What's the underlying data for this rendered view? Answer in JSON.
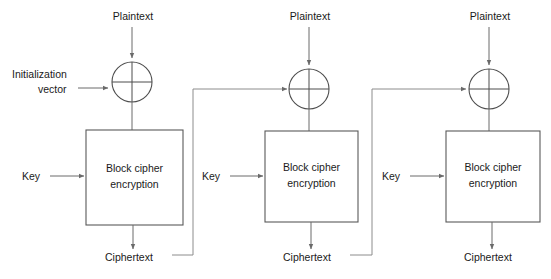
{
  "figure": {
    "background_color": "#ffffff",
    "line_color": "#6a6a6a",
    "text_color": "#1a1a1a",
    "box_fill": "#ffffff",
    "box_stroke": "#595959"
  },
  "labels": {
    "plaintext": "Plaintext",
    "ciphertext": "Ciphertext",
    "key": "Key",
    "iv_line1": "Initialization",
    "iv_line2": "vector",
    "block_cipher_line1": "Block cipher",
    "block_cipher_line2": "encryption"
  },
  "stages": [
    {
      "index": 1,
      "plaintext_label": "Plaintext",
      "plaintext_x": 133,
      "plaintext_y": 20,
      "xor_cx": 132,
      "xor_cy": 82,
      "xor_r": 20,
      "box_x": 86,
      "box_y": 130,
      "box_w": 97,
      "box_h": 95,
      "box_line1": "Block cipher",
      "box_line2": "encryption",
      "key_label": "Key",
      "key_text_x": 22,
      "key_text_y": 180,
      "key_arrow_x1": 50,
      "key_arrow_x2": 84,
      "key_arrow_y": 176,
      "ciphertext_label": "Ciphertext",
      "ciphertext_x": 105,
      "ciphertext_y": 261,
      "has_iv_input": true,
      "has_feedback_out": true,
      "feedback_x": 193
    },
    {
      "index": 2,
      "plaintext_label": "Plaintext",
      "plaintext_x": 310,
      "plaintext_y": 20,
      "xor_cx": 309,
      "xor_cy": 89,
      "xor_r": 20,
      "box_x": 265,
      "box_y": 131,
      "box_w": 93,
      "box_h": 91,
      "box_line1": "Block cipher",
      "box_line2": "encryption",
      "key_label": "Key",
      "key_text_x": 202,
      "key_text_y": 180,
      "key_arrow_x1": 230,
      "key_arrow_x2": 263,
      "key_arrow_y": 176,
      "ciphertext_label": "Ciphertext",
      "ciphertext_x": 283,
      "ciphertext_y": 261,
      "has_iv_input": false,
      "has_feedback_out": true,
      "feedback_x": 372
    },
    {
      "index": 3,
      "plaintext_label": "Plaintext",
      "plaintext_x": 490,
      "plaintext_y": 20,
      "xor_cx": 489,
      "xor_cy": 89,
      "xor_r": 20,
      "box_x": 446,
      "box_y": 131,
      "box_w": 94,
      "box_h": 91,
      "box_line1": "Block cipher",
      "box_line2": "encryption",
      "key_label": "Key",
      "key_text_x": 382,
      "key_text_y": 180,
      "key_arrow_x1": 410,
      "key_arrow_x2": 444,
      "key_arrow_y": 176,
      "ciphertext_label": "Ciphertext",
      "ciphertext_x": 464,
      "ciphertext_y": 261,
      "has_iv_input": false,
      "has_feedback_out": false,
      "feedback_x": null
    }
  ],
  "iv_input": {
    "line1": "Initialization",
    "line2": "vector",
    "text_x": 12,
    "text_y1": 78,
    "text_y2": 93,
    "arrow_x1": 78,
    "arrow_x2": 110,
    "arrow_y": 88
  }
}
